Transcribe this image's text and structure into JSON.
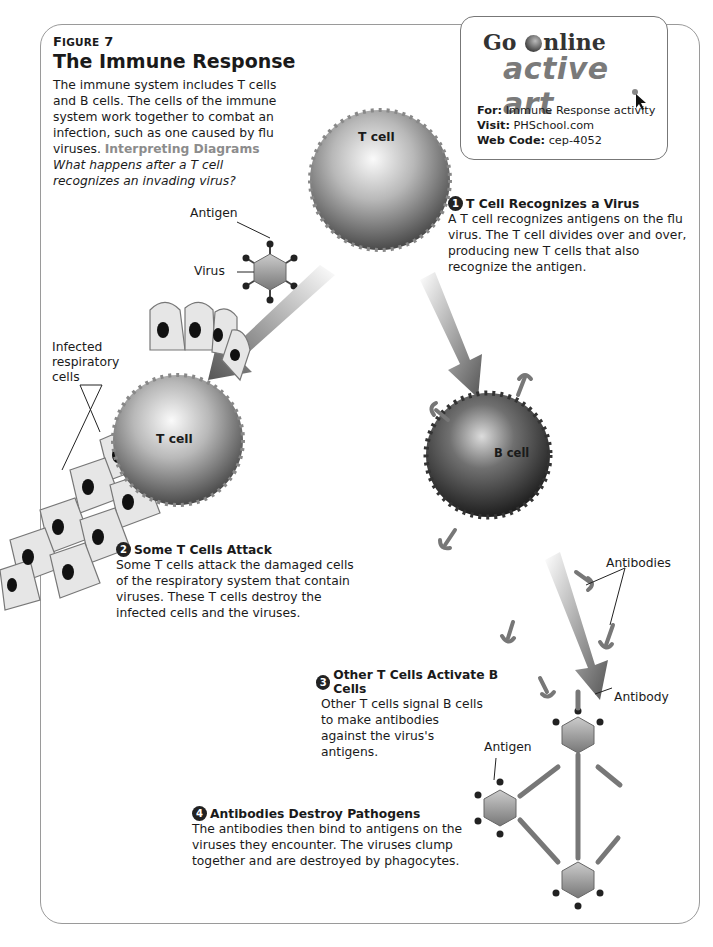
{
  "figure": {
    "label_prefix": "F",
    "label_rest": "IGURE",
    "label_number": "7",
    "title": "The Immune Response",
    "intro": "The immune system includes T cells and B cells. The cells of the immune system work together to combat an infection, such as one caused by flu viruses.",
    "interpreting_label": "Interpreting Diagrams",
    "question": "What happens after a T cell recognizes an invading virus?"
  },
  "go_online": {
    "go_text_before": "Go",
    "go_text_after": "nline",
    "active_art": "active art",
    "for_label": "For:",
    "for_value": "Immune Response activity",
    "visit_label": "Visit:",
    "visit_value": "PHSchool.com",
    "web_code_label": "Web Code:",
    "web_code_value": "cep-4052"
  },
  "labels": {
    "t_cell_top": "T cell",
    "t_cell_attack": "T cell",
    "b_cell": "B cell",
    "antigen_top": "Antigen",
    "virus": "Virus",
    "infected_cells": "Infected respiratory cells",
    "antibodies": "Antibodies",
    "antibody": "Antibody",
    "antigen_bottom": "Antigen"
  },
  "steps": [
    {
      "number": "1",
      "title": "T Cell Recognizes a Virus",
      "body": "A T cell recognizes antigens on the flu virus. The T cell divides over and over, producing new T cells that also recognize the antigen."
    },
    {
      "number": "2",
      "title": "Some T Cells Attack",
      "body": "Some T cells attack the damaged cells of the respiratory system that contain viruses. These T cells destroy the infected cells and the viruses."
    },
    {
      "number": "3",
      "title": "Other T Cells Activate B Cells",
      "body": "Other T cells signal B cells to make antibodies against the virus's antigens."
    },
    {
      "number": "4",
      "title": "Antibodies Destroy Pathogens",
      "body": "The antibodies then bind to antigens on the viruses they encounter. The viruses clump together and are destroyed by phagocytes."
    }
  ],
  "colors": {
    "frame_border": "#9a9a9a",
    "interpreting": "#8c8c8c",
    "active_art": "#7a7a7a",
    "badge": "#222222"
  }
}
